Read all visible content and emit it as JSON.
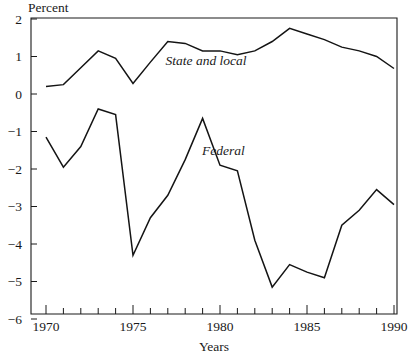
{
  "chart_data": {
    "type": "line",
    "title": "",
    "subtitle": "",
    "xlabel": "Years",
    "ylabel": "Percent",
    "xlim": [
      1970,
      1990
    ],
    "ylim": [
      -6,
      2
    ],
    "grid": false,
    "legend_position": "inline-annotation",
    "x": [
      1970,
      1971,
      1972,
      1973,
      1974,
      1975,
      1976,
      1977,
      1978,
      1979,
      1980,
      1981,
      1982,
      1983,
      1984,
      1985,
      1986,
      1987,
      1988,
      1989,
      1990
    ],
    "x_tick_labels": [
      "1970",
      "1975",
      "1980",
      "1985",
      "1990"
    ],
    "x_tick_values": [
      1970,
      1975,
      1980,
      1985,
      1990
    ],
    "x_minor_tick_values": [
      1971,
      1972,
      1973,
      1974,
      1976,
      1977,
      1978,
      1979,
      1981,
      1982,
      1983,
      1984,
      1986,
      1987,
      1988,
      1989
    ],
    "y_tick_labels": [
      "2",
      "1",
      "0",
      "−1",
      "−2",
      "−3",
      "−4",
      "−5",
      "−6"
    ],
    "y_tick_values": [
      2,
      1,
      0,
      -1,
      -2,
      -3,
      -4,
      -5,
      -6
    ],
    "series": [
      {
        "name": "State and local",
        "annotation": "State and local",
        "annotation_x": 1979.2,
        "annotation_y": 0.78,
        "color": "#141414",
        "values": [
          0.2,
          0.25,
          0.7,
          1.15,
          0.95,
          0.28,
          0.85,
          1.4,
          1.35,
          1.15,
          1.15,
          1.05,
          1.15,
          1.4,
          1.75,
          1.6,
          1.45,
          1.25,
          1.15,
          1.0,
          0.68
        ]
      },
      {
        "name": "Federal",
        "annotation": "Federal",
        "annotation_x": 1980.2,
        "annotation_y": -1.62,
        "color": "#141414",
        "values": [
          -1.15,
          -1.95,
          -1.4,
          -0.4,
          -0.55,
          -4.3,
          -3.3,
          -2.7,
          -1.75,
          -0.65,
          -1.9,
          -2.05,
          -3.9,
          -5.15,
          -4.55,
          -4.75,
          -4.9,
          -3.5,
          -3.1,
          -2.55,
          -2.95
        ]
      }
    ]
  },
  "axes": {
    "y_axis_title": "Percent",
    "x_axis_title": "Years"
  }
}
